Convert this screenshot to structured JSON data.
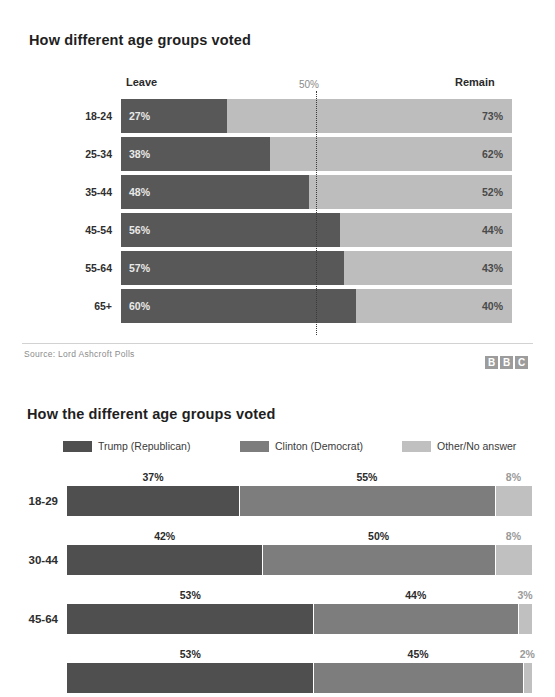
{
  "colors": {
    "leave": "#585858",
    "remain": "#bdbdbd",
    "trump": "#4f4f4f",
    "clinton": "#7d7d7d",
    "other": "#c0c0c0",
    "page_background": "#ffffff",
    "midline": "#3b3b3b"
  },
  "bbc_chart": {
    "title": "How different age groups voted",
    "header_left": "Leave",
    "header_mid": "50%",
    "header_right": "Remain",
    "source": "Source: Lord Ashcroft Polls",
    "logo": [
      "B",
      "B",
      "C"
    ]
  },
  "us_chart": {
    "title": "How the different age groups voted",
    "legend": [
      {
        "label": "Trump (Republican)",
        "color": "#4f4f4f",
        "swatch_name": "legend-swatch-trump"
      },
      {
        "label": "Clinton (Democrat)",
        "color": "#7d7d7d",
        "swatch_name": "legend-swatch-clinton"
      },
      {
        "label": "Other/No answer",
        "color": "#c0c0c0",
        "swatch_name": "legend-swatch-other"
      }
    ]
  },
  "chart_data": [
    {
      "type": "bar",
      "orientation": "horizontal",
      "stacked": true,
      "normalized_percent": true,
      "title": "How different age groups voted",
      "subtitle": "",
      "xlabel": "",
      "ylabel": "",
      "xlim": [
        0,
        100
      ],
      "grid": false,
      "legend_position": "top",
      "reference_line": {
        "value": 50,
        "label": "50%",
        "style": "dotted"
      },
      "categories": [
        "18-24",
        "25-34",
        "35-44",
        "45-54",
        "55-64",
        "65+"
      ],
      "series": [
        {
          "name": "Leave",
          "color": "#585858",
          "values": [
            27,
            38,
            48,
            56,
            57,
            60
          ],
          "labels": [
            "27%",
            "38%",
            "48%",
            "56%",
            "57%",
            "60%"
          ]
        },
        {
          "name": "Remain",
          "color": "#bdbdbd",
          "values": [
            73,
            62,
            52,
            44,
            43,
            40
          ],
          "labels": [
            "73%",
            "62%",
            "52%",
            "44%",
            "43%",
            "40%"
          ]
        }
      ],
      "annotations": [
        "Source: Lord Ashcroft Polls"
      ]
    },
    {
      "type": "bar",
      "orientation": "horizontal",
      "stacked": true,
      "normalized_percent": true,
      "title": "How the different age groups voted",
      "subtitle": "",
      "xlabel": "",
      "ylabel": "",
      "xlim": [
        0,
        100
      ],
      "grid": false,
      "legend_position": "top",
      "categories": [
        "18-29",
        "30-44",
        "45-64",
        ""
      ],
      "series": [
        {
          "name": "Trump (Republican)",
          "color": "#4f4f4f",
          "values": [
            37,
            42,
            53,
            53
          ],
          "labels": [
            "37%",
            "42%",
            "53%",
            "53%"
          ]
        },
        {
          "name": "Clinton (Democrat)",
          "color": "#7d7d7d",
          "values": [
            55,
            50,
            44,
            45
          ],
          "labels": [
            "55%",
            "50%",
            "44%",
            "45%"
          ]
        },
        {
          "name": "Other/No answer",
          "color": "#c0c0c0",
          "values": [
            8,
            8,
            3,
            2
          ],
          "labels": [
            "8%",
            "8%",
            "3%",
            "2%"
          ]
        }
      ],
      "note": "fourth row is cropped at the bottom edge of the screenshot; its category label is not visible"
    }
  ]
}
